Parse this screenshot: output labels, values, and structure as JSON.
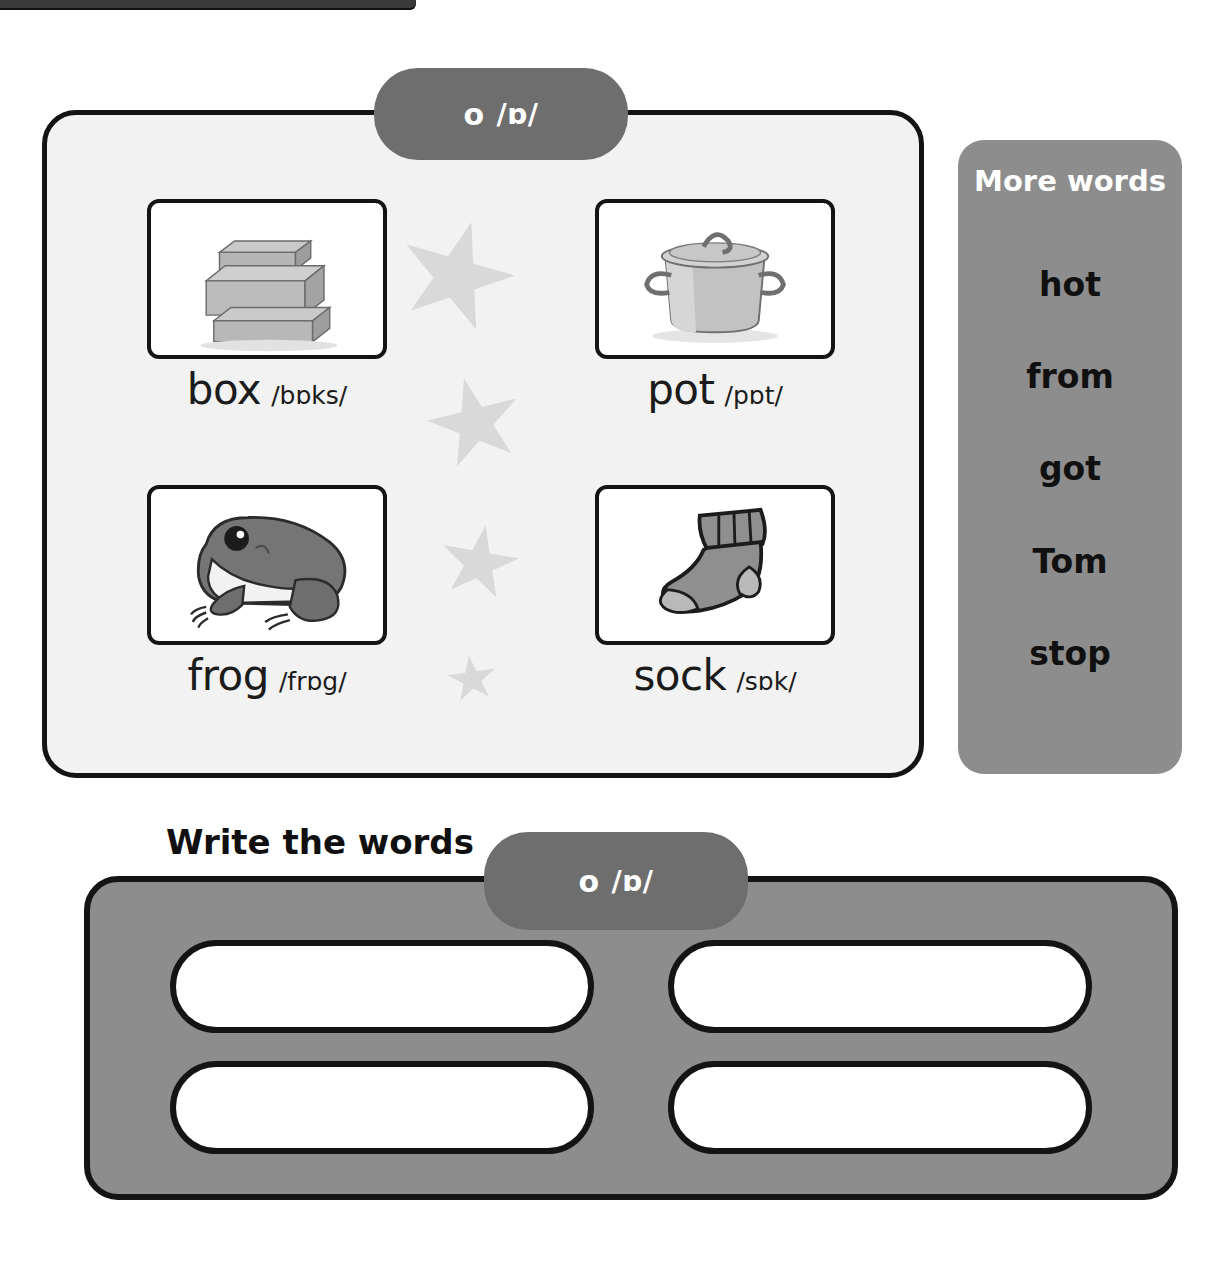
{
  "page": {
    "type": "phonics-worksheet",
    "top_bar_visible": true
  },
  "sound_tags": {
    "top": {
      "letter": "o",
      "ipa": "/ɒ/"
    },
    "write_section": {
      "letter": "o",
      "ipa": "/ɒ/"
    }
  },
  "picture_cards": [
    {
      "word": "box",
      "ipa": "/bɒks/",
      "image": "boxes-image",
      "position": "top-left"
    },
    {
      "word": "pot",
      "ipa": "/pɒt/",
      "image": "pot-image",
      "position": "top-right"
    },
    {
      "word": "frog",
      "ipa": "/frɒg/",
      "image": "frog-image",
      "position": "bottom-left"
    },
    {
      "word": "sock",
      "ipa": "/sɒk/",
      "image": "sock-image",
      "position": "bottom-right"
    }
  ],
  "more_words": {
    "title": "More words",
    "items": [
      "hot",
      "from",
      "got",
      "Tom",
      "stop"
    ]
  },
  "write_section": {
    "heading": "Write the words",
    "answer_boxes": [
      "",
      "",
      "",
      ""
    ]
  },
  "colors": {
    "pill_gray": "#6e6e6e",
    "panel_gray": "#8d8d8d",
    "picture_panel_fill": "#f2f2f2",
    "outline_black": "#141414",
    "star_gray": "#d9d9d9",
    "text_black": "#101010",
    "text_white": "#ffffff"
  }
}
